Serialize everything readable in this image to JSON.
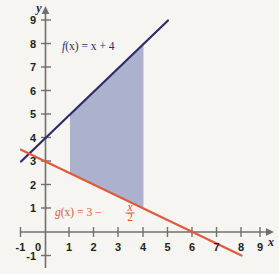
{
  "figure": {
    "background_color": "#f7f5f1",
    "axis_color": "#6f6f6f",
    "x_axis_name": "x",
    "y_axis_name": "y"
  },
  "labels": {
    "f_label_prefix": "f",
    "f_label_body": "(x) = x + 4",
    "g_label_prefix": "g",
    "g_label_body": "(x) = 3 − ",
    "g_frac_num": "x",
    "g_frac_den": "2"
  },
  "chart_data": {
    "type": "line",
    "title": "",
    "xlabel": "x",
    "ylabel": "y",
    "xlim": [
      -1,
      9
    ],
    "ylim": [
      -1,
      9
    ],
    "xticks": [
      -1,
      0,
      1,
      2,
      3,
      4,
      5,
      6,
      7,
      8,
      9
    ],
    "xtick_labels": [
      "-1",
      "0",
      "1",
      "2",
      "3",
      "4",
      "5",
      "6",
      "7",
      "8",
      "9"
    ],
    "yticks": [
      -1,
      0,
      1,
      2,
      3,
      4,
      5,
      6,
      7,
      8,
      9
    ],
    "ytick_labels": [
      "-1",
      "0",
      "1",
      "2",
      "3",
      "4",
      "5",
      "6",
      "7",
      "8",
      "9"
    ],
    "grid": false,
    "legend_position": "inline-annotations",
    "series": [
      {
        "name": "f(x) = x + 4",
        "expression": "x + 4",
        "slope": 1,
        "intercept": 4,
        "color": "#2c2c6b",
        "x": [
          -1,
          5
        ],
        "values": [
          3,
          9
        ],
        "annotation": "f(x) = x + 4",
        "annotation_xy": [
          2.1,
          7.85
        ]
      },
      {
        "name": "g(x) = 3 - x/2",
        "expression": "3 - x/2",
        "slope": -0.5,
        "intercept": 3,
        "color": "#e2593c",
        "x": [
          -1,
          8
        ],
        "values": [
          3.5,
          -1
        ],
        "annotation": "g(x) = 3 - x/2",
        "annotation_xy": [
          1.0,
          0.95
        ]
      }
    ],
    "shaded_region": {
      "label": "region between f and g from x = 1 to x = 4",
      "fill_color": "#a8aecb",
      "x_start": 1,
      "x_end": 4,
      "upper_curve": "f(x) = x + 4",
      "lower_curve": "g(x) = 3 - x/2",
      "corners": [
        [
          1,
          5
        ],
        [
          4,
          8
        ],
        [
          4,
          1
        ],
        [
          1,
          2.5
        ]
      ]
    }
  }
}
